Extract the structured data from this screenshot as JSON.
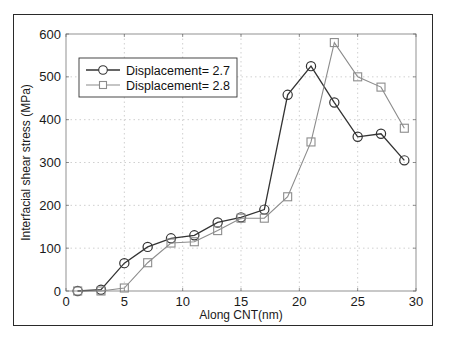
{
  "chart_data": {
    "type": "line",
    "title": "",
    "xlabel": "Along CNT(nm)",
    "ylabel": "Interfacial shear stress (MPa)",
    "xlim": [
      0,
      30
    ],
    "ylim": [
      0,
      600
    ],
    "xticks": [
      0,
      5,
      10,
      15,
      20,
      25,
      30
    ],
    "yticks": [
      0,
      100,
      200,
      300,
      400,
      500,
      600
    ],
    "grid": true,
    "legend_position": "upper left",
    "x": [
      1,
      3,
      5,
      7,
      9,
      11,
      13,
      15,
      17,
      19,
      21,
      23,
      25,
      27,
      29
    ],
    "series": [
      {
        "name": "Displacement= 2.7",
        "marker": "circle",
        "color": "#333333",
        "values": [
          0,
          3,
          65,
          103,
          123,
          130,
          160,
          172,
          190,
          458,
          525,
          440,
          360,
          367,
          305
        ]
      },
      {
        "name": "Displacement= 2.8",
        "marker": "square",
        "color": "#8c8c8c",
        "values": [
          0,
          0,
          7,
          66,
          112,
          115,
          141,
          170,
          170,
          220,
          348,
          580,
          500,
          476,
          380
        ]
      }
    ]
  }
}
